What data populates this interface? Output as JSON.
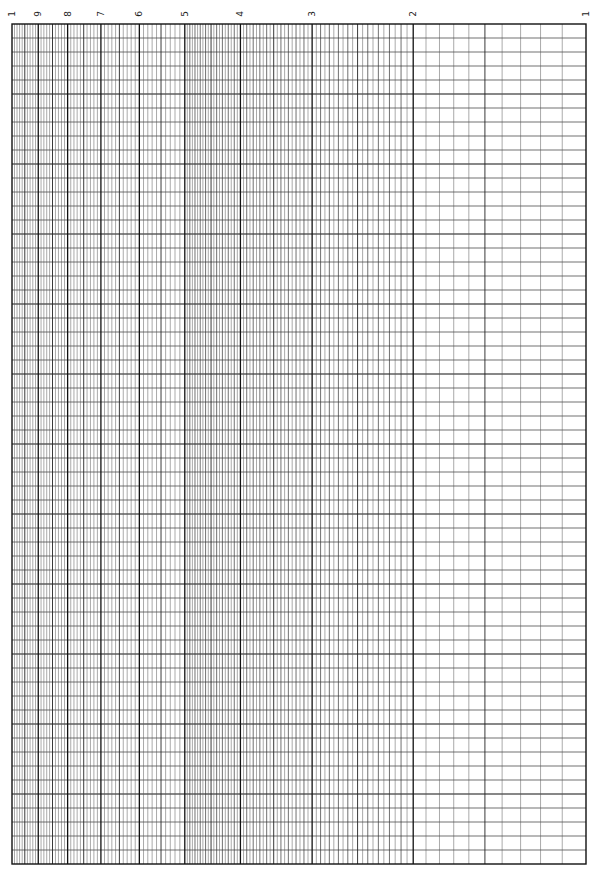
{
  "sheet": {
    "type": "semi-log graph paper",
    "cycles": 1,
    "orientation": "rotated",
    "grid_left_px": 12,
    "grid_right_px": 586,
    "grid_top_px": 24,
    "grid_bottom_px": 864,
    "rows": 60,
    "line_color": "#333333",
    "major_line_color": "#111111",
    "background": "#ffffff"
  },
  "axis": {
    "scale": "log",
    "direction": "right-to-left",
    "labels": [
      {
        "value": 10,
        "text": "1"
      },
      {
        "value": 9,
        "text": "9"
      },
      {
        "value": 8,
        "text": "8"
      },
      {
        "value": 7,
        "text": "7"
      },
      {
        "value": 6,
        "text": "6"
      },
      {
        "value": 5,
        "text": "5"
      },
      {
        "value": 4,
        "text": "4"
      },
      {
        "value": 3,
        "text": "3"
      },
      {
        "value": 2,
        "text": "2"
      },
      {
        "value": 1,
        "text": "1"
      }
    ],
    "subdivisions": [
      {
        "from": 1,
        "to": 2,
        "step": 0.1
      },
      {
        "from": 2,
        "to": 5,
        "step": 0.05
      },
      {
        "from": 5,
        "to": 10,
        "step": 0.1
      }
    ]
  }
}
